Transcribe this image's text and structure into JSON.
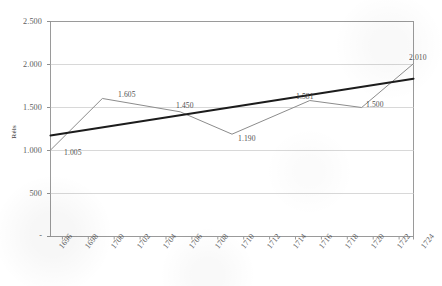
{
  "chart_data": {
    "type": "line",
    "title": "",
    "xlabel": "",
    "ylabel": "Réis",
    "ylim": [
      0,
      2500
    ],
    "yticks": [
      0,
      500,
      1000,
      1500,
      2000,
      2500
    ],
    "ytick_labels": [
      "-",
      "500",
      "1.000",
      "1.500",
      "2.000",
      "2.500"
    ],
    "grid": true,
    "grid_axis": "y",
    "legend": false,
    "legend_position": "none",
    "x": [
      1696,
      1698,
      1700,
      1702,
      1704,
      1706,
      1708,
      1710,
      1712,
      1714,
      1716,
      1718,
      1720,
      1722,
      1724
    ],
    "xtick_labels": [
      "1696",
      "1698",
      "1700",
      "1702",
      "1704",
      "1706",
      "1708",
      "1710",
      "1712",
      "1714",
      "1716",
      "1718",
      "1720",
      "1722",
      "1724"
    ],
    "series": [
      {
        "name": "Réis",
        "style": "thin-gray-line",
        "color": "#8c8c8c",
        "points": [
          {
            "x": 1696,
            "y": 1005,
            "label": "1.005"
          },
          {
            "x": 1700,
            "y": 1605,
            "label": "1.605"
          },
          {
            "x": 1706,
            "y": 1450,
            "label": "1.450"
          },
          {
            "x": 1710,
            "y": 1190,
            "label": "1.190"
          },
          {
            "x": 1716,
            "y": 1581,
            "label": "1.581"
          },
          {
            "x": 1720,
            "y": 1500,
            "label": "1.500"
          },
          {
            "x": 1724,
            "y": 2010,
            "label": "2.010"
          }
        ]
      },
      {
        "name": "trendline",
        "style": "thick-black-line",
        "color": "#1c1c1c",
        "points": [
          {
            "x": 1696,
            "y": 1175,
            "label": ""
          },
          {
            "x": 1724,
            "y": 1835,
            "label": ""
          }
        ]
      }
    ],
    "data_labels": [
      "1.005",
      "1.605",
      "1.450",
      "1.190",
      "1.581",
      "1.500",
      "2.010"
    ],
    "annotations": []
  },
  "axis": {
    "y_title": "Réis"
  }
}
